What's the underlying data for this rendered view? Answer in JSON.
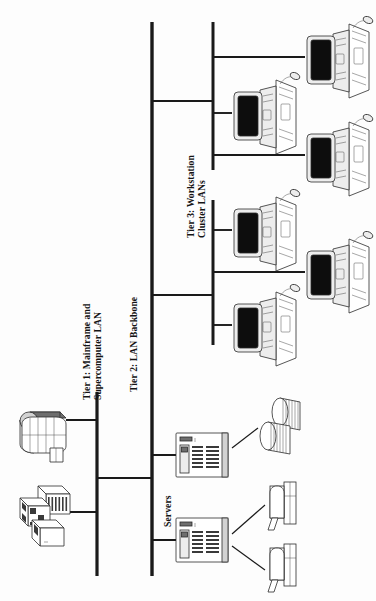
{
  "diagram": {
    "orientation": "rotated-90-ccw",
    "background_color": "#fdfdfd",
    "line_color": "#1a1a1a",
    "labels": {
      "tier1_line1": "Tier 1: Mainframe and",
      "tier1_line2": "Supercomputer LAN",
      "tier2": "Tier 2: LAN Backbone",
      "tier3_line1": "Tier 3: Workstation",
      "tier3_line2": "Cluster LANs",
      "servers": "Servers"
    },
    "buses": [
      {
        "name": "tier1-lan-bus",
        "x": 97,
        "y1": 392,
        "y2": 576,
        "width": 3.2
      },
      {
        "name": "tier2-backbone-bus",
        "x": 152,
        "y1": 22,
        "y2": 576,
        "width": 3.4
      },
      {
        "name": "tier3-cluster-bus-upper",
        "x": 213,
        "y1": 22,
        "y2": 170,
        "width": 3.0
      },
      {
        "name": "tier3-cluster-bus-lower",
        "x": 213,
        "y1": 200,
        "y2": 345,
        "width": 3.0
      }
    ],
    "trunk_links": [
      {
        "name": "tier1-to-tier2-link",
        "x1": 97,
        "x2": 152,
        "y": 478
      },
      {
        "name": "tier2-to-cluster-upper-link",
        "x1": 152,
        "x2": 213,
        "y": 101
      },
      {
        "name": "tier2-to-cluster-lower-link",
        "x1": 152,
        "x2": 213,
        "y": 295
      }
    ],
    "nodes": [
      {
        "name": "supercomputer",
        "icon": "supercomputer-icon",
        "bus": "tier1-lan-bus",
        "drop_y": 420,
        "x": 47,
        "y": 430
      },
      {
        "name": "mainframe",
        "icon": "mainframe-icon",
        "bus": "tier1-lan-bus",
        "drop_y": 512,
        "x": 45,
        "y": 512
      },
      {
        "name": "server-upper",
        "icon": "server-rack-icon",
        "bus": "tier2-backbone-bus",
        "drop_y": 455,
        "x": 200,
        "y": 455
      },
      {
        "name": "server-lower",
        "icon": "server-rack-icon",
        "bus": "tier2-backbone-bus",
        "drop_y": 540,
        "x": 200,
        "y": 540
      },
      {
        "name": "disk-storage-array",
        "icon": "disk-array-icon",
        "attached_to": "server-upper",
        "x": 275,
        "y": 420
      },
      {
        "name": "printer-upper",
        "icon": "printer-icon",
        "attached_to": "server-lower",
        "x": 280,
        "y": 505
      },
      {
        "name": "printer-lower",
        "icon": "printer-icon",
        "attached_to": "server-lower",
        "x": 280,
        "y": 565
      },
      {
        "name": "workstation-1",
        "icon": "workstation-icon",
        "bus": "tier3-cluster-bus-upper",
        "drop_y": 57,
        "x": 330,
        "y": 57
      },
      {
        "name": "workstation-2",
        "icon": "workstation-icon",
        "bus": "tier3-cluster-bus-upper",
        "drop_y": 113,
        "x": 258,
        "y": 113
      },
      {
        "name": "workstation-3",
        "icon": "workstation-icon",
        "bus": "tier3-cluster-bus-upper",
        "drop_y": 155,
        "x": 330,
        "y": 155
      },
      {
        "name": "workstation-4",
        "icon": "workstation-icon",
        "bus": "tier3-cluster-bus-lower",
        "drop_y": 230,
        "x": 258,
        "y": 230
      },
      {
        "name": "workstation-5",
        "icon": "workstation-icon",
        "bus": "tier3-cluster-bus-lower",
        "drop_y": 272,
        "x": 330,
        "y": 272
      },
      {
        "name": "workstation-6",
        "icon": "workstation-icon",
        "bus": "tier3-cluster-bus-lower",
        "drop_y": 325,
        "x": 258,
        "y": 325
      }
    ],
    "counts": {
      "workstations": 6,
      "servers": 2,
      "printers": 2,
      "storage_arrays": 1,
      "mainframes": 1,
      "supercomputers": 1
    }
  }
}
